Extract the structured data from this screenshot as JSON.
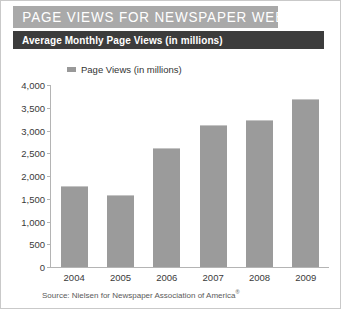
{
  "header": {
    "title": "PAGE VIEWS FOR NEWSPAPER WEBSITES",
    "subtitle": "Average Monthly Page Views (in millions)",
    "title_bar_color": "#a9a9a9",
    "subtitle_bar_color": "#3c3c3c"
  },
  "legend": {
    "entries": [
      {
        "label": "Page Views (in millions)",
        "color": "#999999"
      }
    ]
  },
  "source": {
    "text": "Source: Nielsen for Newspaper Association of America",
    "mark": "®"
  },
  "chart_data": {
    "type": "bar",
    "title": "PAGE VIEWS FOR NEWSPAPER WEBSITES",
    "subtitle": "Average Monthly Page Views (in millions)",
    "xlabel": "",
    "ylabel": "",
    "categories": [
      "2004",
      "2005",
      "2006",
      "2007",
      "2008",
      "2009"
    ],
    "values": [
      1780,
      1580,
      2620,
      3120,
      3230,
      3690
    ],
    "series": [
      {
        "name": "Page Views (in millions)",
        "color": "#9b9b9b",
        "values": [
          1780,
          1580,
          2620,
          3120,
          3230,
          3690
        ]
      }
    ],
    "ylim": [
      0,
      4000
    ],
    "ytick_values": [
      0,
      500,
      1000,
      1500,
      2000,
      2500,
      3000,
      3500,
      4000
    ],
    "ytick_labels": [
      "0",
      "500",
      "1,000",
      "1,500",
      "2,000",
      "2,500",
      "3,000",
      "3,500",
      "4,000"
    ],
    "grid": false,
    "legend_position": "top-left",
    "bar_color": "#9b9b9b",
    "axis_color": "#b4b4b4"
  }
}
